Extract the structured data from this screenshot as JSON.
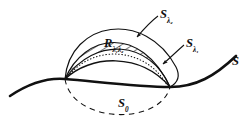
{
  "figure": {
    "kind": "geometry-diagram",
    "background_color": "#ffffff",
    "ink_color": "#111111",
    "labels": {
      "outer_cap": {
        "base": "S",
        "sub": "λ₂"
      },
      "inner_cap": {
        "base": "S",
        "sub": "λ₁"
      },
      "region": {
        "base": "R",
        "sub": "λ₁λ₂"
      },
      "lower_cap": {
        "base": "S",
        "sub": "0"
      },
      "surface": {
        "base": "S",
        "sub": ""
      }
    },
    "strokes": {
      "surface_curve": "solid-thick",
      "outer_cap_arc": "solid-thin",
      "inner_cap_arc": "solid-thin",
      "dotted_arc": "dotted",
      "lower_cap_arc": "dashed",
      "hatching": "diagonal-lines"
    },
    "nodes": {
      "left_intersection": {
        "x": 65,
        "y": 79
      },
      "right_intersection": {
        "x": 170,
        "y": 87
      }
    }
  }
}
